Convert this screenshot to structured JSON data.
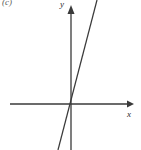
{
  "figure": {
    "part_label": "(c)",
    "background_color": "#ffffff",
    "ink_color": "#3a3a3a",
    "width": 141,
    "height": 150
  },
  "axes": {
    "x_label": "x",
    "y_label": "y",
    "x_arrow": "arrow-right",
    "y_arrow": "arrow-up",
    "origin": {
      "x": 71,
      "y": 104
    },
    "x_axis_start": 10,
    "x_axis_end": 134,
    "y_axis_top": 6,
    "y_axis_bottom": 150,
    "ticks": [],
    "tick_labels": []
  },
  "chart_data": {
    "type": "line",
    "title": "(c)",
    "xlabel": "x",
    "ylabel": "y",
    "grid": false,
    "legend": null,
    "axis_style": "arrows-both-ends",
    "xlim": [
      -4.7,
      5.0
    ],
    "ylim": [
      -3.6,
      3.8
    ],
    "series": [
      {
        "name": "line through origin",
        "equation": "y = 4x",
        "slope": 4,
        "intercept": 0,
        "x": [
          -1.21,
          0,
          1.02
        ],
        "y": [
          -4.84,
          0,
          4.08
        ],
        "pixel_points": [
          {
            "x": 58,
            "y": 150
          },
          {
            "x": 71,
            "y": 104
          },
          {
            "x": 97,
            "y": 0
          }
        ]
      }
    ],
    "annotations": []
  }
}
